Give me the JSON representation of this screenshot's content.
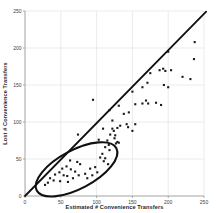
{
  "chart_data": {
    "type": "scatter",
    "title": "",
    "xlabel": "Estimated # Convenience Transfers",
    "ylabel": "Lost # Convenience Transfers",
    "xlim": [
      0,
      250
    ],
    "ylim": [
      0,
      250
    ],
    "xticks": [
      0,
      50,
      100,
      150,
      200,
      250
    ],
    "yticks": [
      0,
      50,
      100,
      150,
      200,
      250
    ],
    "grid": true,
    "legend": false,
    "marker": {
      "shape": "square",
      "size_px": 2.1,
      "color": "#1a1a1a"
    },
    "identity_line": {
      "from": [
        0,
        0
      ],
      "to": [
        253,
        249
      ],
      "color": "#101010",
      "width_px": 1.8
    },
    "ellipse_annotation": {
      "center": [
        72,
        36
      ],
      "rx": 63,
      "ry": 26,
      "rotation_deg": 28,
      "color": "#101010",
      "width_px": 2.1,
      "meaning": "circles dense cluster of low-value points"
    },
    "points": [
      [
        28,
        15
      ],
      [
        32,
        18
      ],
      [
        35,
        24
      ],
      [
        40,
        21
      ],
      [
        42,
        29
      ],
      [
        48,
        32
      ],
      [
        49,
        20
      ],
      [
        52,
        37
      ],
      [
        54,
        28
      ],
      [
        58,
        40
      ],
      [
        59,
        27
      ],
      [
        60,
        19
      ],
      [
        63,
        48
      ],
      [
        64,
        36
      ],
      [
        67,
        24
      ],
      [
        70,
        33
      ],
      [
        73,
        46
      ],
      [
        75,
        28
      ],
      [
        77,
        43
      ],
      [
        84,
        30
      ],
      [
        87,
        24
      ],
      [
        91,
        37
      ],
      [
        94,
        28
      ],
      [
        98,
        39
      ],
      [
        101,
        32
      ],
      [
        105,
        52
      ],
      [
        108,
        57
      ],
      [
        110,
        47
      ],
      [
        112,
        51
      ],
      [
        116,
        43
      ],
      [
        74,
        83
      ],
      [
        103,
        76
      ],
      [
        109,
        91
      ],
      [
        112,
        66
      ],
      [
        115,
        75
      ],
      [
        117,
        69
      ],
      [
        118,
        62
      ],
      [
        119,
        83
      ],
      [
        122,
        91
      ],
      [
        122,
        102
      ],
      [
        124,
        88
      ],
      [
        125,
        78
      ],
      [
        126,
        82
      ],
      [
        127,
        71
      ],
      [
        129,
        73
      ],
      [
        129,
        92
      ],
      [
        131,
        72
      ],
      [
        133,
        95
      ],
      [
        138,
        111
      ],
      [
        142,
        97
      ],
      [
        144,
        93
      ],
      [
        145,
        113
      ],
      [
        150,
        88
      ],
      [
        131,
        122
      ],
      [
        150,
        141
      ],
      [
        154,
        97
      ],
      [
        154,
        124
      ],
      [
        164,
        125
      ],
      [
        164,
        147
      ],
      [
        169,
        129
      ],
      [
        171,
        153
      ],
      [
        172,
        125
      ],
      [
        175,
        166
      ],
      [
        183,
        126
      ],
      [
        188,
        170
      ],
      [
        190,
        123
      ],
      [
        193,
        172
      ],
      [
        194,
        150
      ],
      [
        196,
        169
      ],
      [
        200,
        147
      ],
      [
        200,
        195
      ],
      [
        204,
        170
      ],
      [
        220,
        161
      ],
      [
        231,
        158
      ],
      [
        236,
        185
      ],
      [
        237,
        208
      ],
      [
        95,
        130
      ],
      [
        118,
        116
      ]
    ],
    "layout": {
      "plot_left_px": 25,
      "plot_right_px": 204,
      "plot_top_px": 11,
      "plot_bottom_px": 196,
      "grid_color": "#e2e2e2",
      "spine_color": "#9a9a9a",
      "tick_color": "#8a8a8a",
      "background": "#ffffff"
    }
  }
}
